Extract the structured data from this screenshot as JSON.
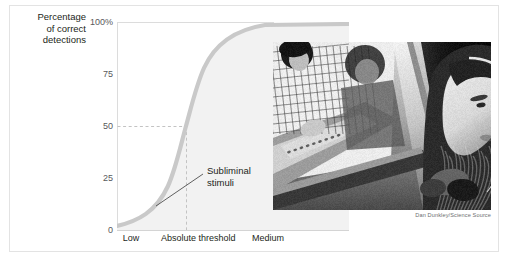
{
  "figure": {
    "background": "#ffffff",
    "border_color": "#e3e3e3"
  },
  "axis_title": {
    "line1": "Percentage",
    "line2": "of correct",
    "line3": "detections"
  },
  "annotation": {
    "line1": "Subliminal",
    "line2": "stimuli"
  },
  "photo": {
    "alt": "Girl wearing headphones in a hearing test booth while technicians operate an audiometer behind a glass window",
    "credit": "Dan Dunkley/Science Source"
  },
  "chart_data": {
    "type": "line",
    "title": "",
    "xlabel": "",
    "ylabel": "Percentage of correct detections",
    "ylim": [
      0,
      100
    ],
    "ytick_labels": [
      "100%",
      "75",
      "50",
      "25",
      "0"
    ],
    "ytick_values": [
      100,
      75,
      50,
      25,
      0
    ],
    "xtick_labels": [
      "Low",
      "Absolute threshold",
      "Medium"
    ],
    "xtick_values": [
      0,
      50,
      90
    ],
    "xlim": [
      0,
      100
    ],
    "grid": false,
    "legend": "none",
    "curve_color": "#c9c9c9",
    "fill_color": "#f2f2f2",
    "guide_color": "#c3c3c3",
    "series": [
      {
        "name": "Detection probability",
        "x": [
          0,
          5,
          10,
          15,
          20,
          25,
          30,
          35,
          40,
          45,
          50,
          55,
          60,
          65,
          70,
          75,
          80,
          85,
          90,
          95,
          100
        ],
        "values": [
          2,
          2.6,
          3.4,
          4.4,
          5.8,
          7.5,
          9.8,
          13,
          17.5,
          28,
          50,
          70,
          82,
          89,
          93.5,
          96,
          97.5,
          98.5,
          99.2,
          99.6,
          100
        ]
      }
    ],
    "annotations": [
      {
        "text": "Subliminal stimuli",
        "x": 50,
        "y": 50,
        "note": "Region left of the absolute threshold where stimuli are below conscious detection"
      }
    ],
    "guides": [
      {
        "type": "horizontal",
        "value": 50,
        "style": "dashed",
        "from_x": 0,
        "to_x": 50
      },
      {
        "type": "vertical",
        "value": 50,
        "style": "dashed",
        "from_y": 0,
        "to_y": 50
      }
    ]
  }
}
